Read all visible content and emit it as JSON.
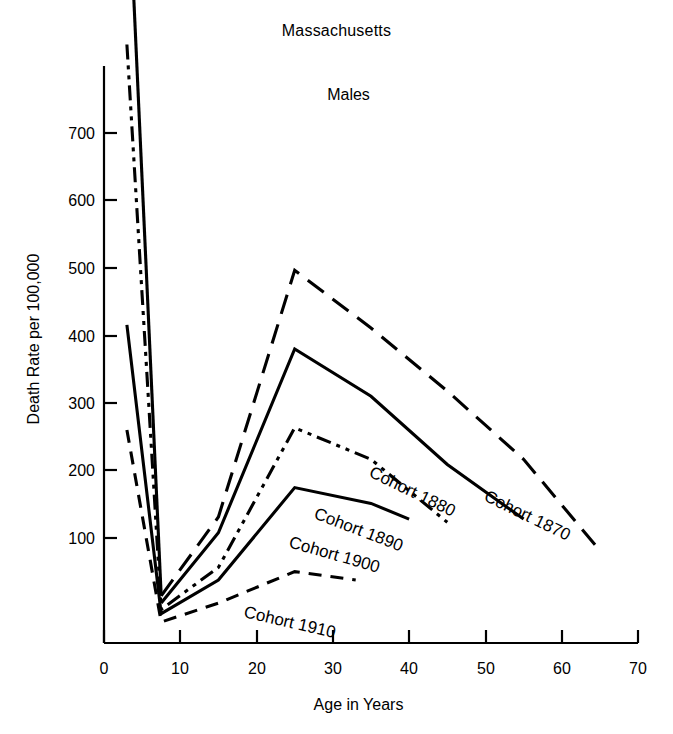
{
  "chart_data": {
    "type": "line",
    "title": "Massachusetts",
    "subtitle": "Males",
    "xlabel": "Age in Years",
    "ylabel": "Death Rate per 100,000",
    "xlim": [
      0,
      70
    ],
    "ylim": [
      0,
      780
    ],
    "xticks": [
      0,
      10,
      20,
      30,
      40,
      50,
      60,
      70
    ],
    "yticks": [
      100,
      200,
      300,
      400,
      500,
      600,
      700
    ],
    "xtick_labels": [
      "0",
      "10",
      "20",
      "30",
      "40",
      "50",
      "60",
      "70"
    ],
    "ytick_labels": [
      "100",
      "200",
      "300",
      "400",
      "500",
      "600",
      "700"
    ],
    "grid": false,
    "legend_position": "inline-curve-labels",
    "series": [
      {
        "name": "Cohort 1870",
        "label": "Cohort 1870",
        "linestyle": "solid-then-long-dash",
        "x": [
          3,
          7.5,
          15,
          25,
          35,
          45,
          55,
          65
        ],
        "y": [
          757,
          45,
          120,
          355,
          300,
          240,
          175,
          88
        ]
      },
      {
        "name": "Cohort 1880",
        "label": "Cohort 1880",
        "linestyle": "solid",
        "x": [
          7.5,
          15,
          25,
          35,
          45,
          55
        ],
        "y": [
          38,
          105,
          280,
          235,
          170,
          118
        ]
      },
      {
        "name": "Cohort 1890",
        "label": "Cohort 1890",
        "linestyle": "dash-dot-dot",
        "x": [
          3,
          7.5,
          15,
          25,
          35,
          45
        ],
        "y": [
          570,
          32,
          72,
          205,
          175,
          115
        ]
      },
      {
        "name": "Cohort 1900",
        "label": "Cohort 1900",
        "linestyle": "solid",
        "x": [
          3,
          7.5,
          15,
          25,
          35,
          40
        ],
        "y": [
          303,
          28,
          60,
          148,
          133,
          118
        ]
      },
      {
        "name": "Cohort 1910",
        "label": "Cohort 1910",
        "linestyle": "dashed",
        "x": [
          3,
          7.5,
          15,
          25,
          33
        ],
        "y": [
          203,
          20,
          38,
          68,
          60
        ]
      }
    ]
  }
}
